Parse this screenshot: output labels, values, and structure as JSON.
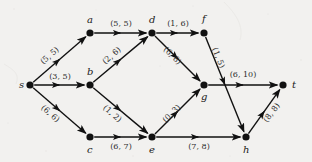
{
  "diagram": {
    "type": "directed-graph",
    "style": {
      "background": "#f2f1ef",
      "node_color": "#111111",
      "edge_color": "#111111",
      "label_color": "#2b2b2b"
    },
    "nodes": [
      {
        "id": "s",
        "label": "s",
        "x": 30,
        "y": 85,
        "label_dx": -11,
        "label_dy": -5
      },
      {
        "id": "a",
        "label": "a",
        "x": 90,
        "y": 33,
        "label_dx": -3,
        "label_dy": -18
      },
      {
        "id": "b",
        "label": "b",
        "x": 90,
        "y": 85,
        "label_dx": -3,
        "label_dy": -18
      },
      {
        "id": "c",
        "label": "c",
        "x": 90,
        "y": 137,
        "label_dx": -3,
        "label_dy": 8
      },
      {
        "id": "d",
        "label": "d",
        "x": 152,
        "y": 33,
        "label_dx": -3,
        "label_dy": -18
      },
      {
        "id": "e",
        "label": "e",
        "x": 152,
        "y": 137,
        "label_dx": -3,
        "label_dy": 8
      },
      {
        "id": "f",
        "label": "f",
        "x": 204,
        "y": 33,
        "label_dx": -2,
        "label_dy": -19
      },
      {
        "id": "g",
        "label": "g",
        "x": 204,
        "y": 85,
        "label_dx": -3,
        "label_dy": 7
      },
      {
        "id": "h",
        "label": "h",
        "x": 246,
        "y": 137,
        "label_dx": -3,
        "label_dy": 8
      },
      {
        "id": "t",
        "label": "t",
        "x": 283,
        "y": 85,
        "label_dx": 9,
        "label_dy": -5
      }
    ],
    "edges": [
      {
        "from": "s",
        "to": "a",
        "label": "(5, 5)",
        "lx": 50,
        "ly": 56,
        "rot": -41
      },
      {
        "from": "s",
        "to": "b",
        "label": "(3, 5)",
        "lx": 60,
        "ly": 77,
        "rot": 0
      },
      {
        "from": "s",
        "to": "c",
        "label": "(6, 6)",
        "lx": 50,
        "ly": 114,
        "rot": 41
      },
      {
        "from": "a",
        "to": "d",
        "label": "(5, 5)",
        "lx": 121,
        "ly": 24,
        "rot": 0
      },
      {
        "from": "b",
        "to": "d",
        "label": "(2, 6)",
        "lx": 112,
        "ly": 56,
        "rot": -41
      },
      {
        "from": "b",
        "to": "e",
        "label": "(1, 2)",
        "lx": 112,
        "ly": 114,
        "rot": 41
      },
      {
        "from": "c",
        "to": "e",
        "label": "(6, 7)",
        "lx": 121,
        "ly": 147,
        "rot": 0
      },
      {
        "from": "d",
        "to": "f",
        "label": "(1, 6)",
        "lx": 178,
        "ly": 24,
        "rot": 0
      },
      {
        "from": "d",
        "to": "g",
        "label": "(6, 8)",
        "lx": 172,
        "ly": 56,
        "rot": 45
      },
      {
        "from": "e",
        "to": "g",
        "label": "(0, 3)",
        "lx": 172,
        "ly": 114,
        "rot": -45
      },
      {
        "from": "e",
        "to": "h",
        "label": "(7, 8)",
        "lx": 199,
        "ly": 147,
        "rot": 0
      },
      {
        "from": "f",
        "to": "h",
        "label": "(1, 5)",
        "lx": 218,
        "ly": 58,
        "rot": 68
      },
      {
        "from": "g",
        "to": "t",
        "label": "(6, 10)",
        "lx": 243,
        "ly": 75,
        "rot": 0
      },
      {
        "from": "h",
        "to": "t",
        "label": "(8, 8)",
        "lx": 272,
        "ly": 113,
        "rot": -53
      }
    ]
  }
}
